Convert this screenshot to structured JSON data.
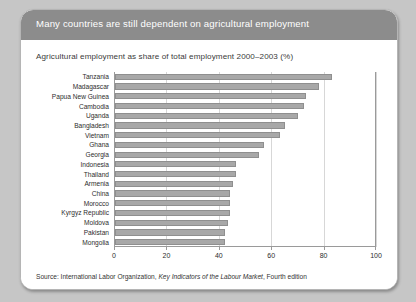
{
  "figure": {
    "header_title": "Many countries are still dependent on agricultural employment",
    "subtitle": "Agricultural employment as share of total employment 2000–2003 (%)",
    "source_prefix": "Source: International Labor Organization, ",
    "source_italic": "Key Indicators of the Labour Market",
    "source_suffix": ", Fourth edition"
  },
  "colors": {
    "page_background": "#c6c6c6",
    "header_band": "#8c8c8c",
    "card_background": "#ffffff",
    "bar_fill": "#a8a8a8",
    "bar_stroke": "#8f8f8f",
    "gridline": "#d7d7d7",
    "axis": "#9a9a9a",
    "header_text": "#ffffff",
    "body_text": "#2d2d2d"
  },
  "chart_data": {
    "type": "bar",
    "orientation": "horizontal",
    "title": "Agricultural employment as share of total employment 2000–2003 (%)",
    "xlabel": "",
    "ylabel": "",
    "xlim": [
      0,
      100
    ],
    "xticks": [
      0,
      20,
      40,
      60,
      80,
      100
    ],
    "xtick_labels": [
      "0",
      "20",
      "40",
      "60",
      "80",
      "100"
    ],
    "grid": "vertical",
    "legend": "none",
    "categories": [
      "Tanzania",
      "Madagascar",
      "Papua New Guinea",
      "Cambodia",
      "Uganda",
      "Bangladesh",
      "Vietnam",
      "Ghana",
      "Georgia",
      "Indonesia",
      "Thailand",
      "Armenia",
      "China",
      "Morocco",
      "Kyrgyz Republic",
      "Moldova",
      "Pakistan",
      "Mongolia"
    ],
    "values": [
      83,
      78,
      73,
      72,
      70,
      65,
      63,
      57,
      55,
      46,
      46,
      45,
      44,
      44,
      44,
      43,
      42,
      42
    ]
  }
}
